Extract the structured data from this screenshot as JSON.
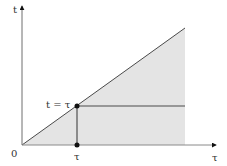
{
  "diagram": {
    "axes": {
      "vertical_label": "t",
      "horizontal_label": "τ",
      "origin_label": "0"
    },
    "point_label": "t = τ",
    "tick_label": "τ",
    "colors": {
      "shade": "#e4e4e4",
      "line": "#4a4a4a",
      "axis": "#6e6e6e",
      "point": "#111111"
    }
  }
}
